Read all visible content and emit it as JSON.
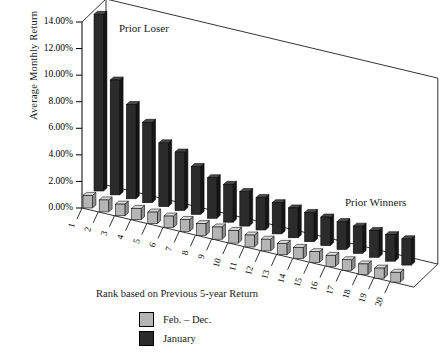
{
  "chart_data": {
    "type": "bar",
    "title": "",
    "subtitle": "",
    "xlabel": "Rank based on Previous 5-year Return",
    "ylabel": "Average Monthly Return",
    "ylim": [
      0,
      14
    ],
    "ytick_labels": [
      "0.00%",
      "2.00%",
      "4.00%",
      "6.00%",
      "8.00%",
      "10.00%",
      "12.00%",
      "14.00%"
    ],
    "ytick_values": [
      0,
      2,
      4,
      6,
      8,
      10,
      12,
      14
    ],
    "grid": false,
    "legend_position": "bottom",
    "categories": [
      "1",
      "2",
      "3",
      "4",
      "5",
      "6",
      "7",
      "8",
      "9",
      "10",
      "11",
      "12",
      "13",
      "14",
      "15",
      "16",
      "17",
      "18",
      "19",
      "20"
    ],
    "series": [
      {
        "name": "Feb. – Dec.",
        "color": "#b5b5b5",
        "values": [
          0.95,
          0.9,
          0.88,
          0.85,
          0.87,
          0.86,
          0.9,
          0.88,
          0.92,
          0.95,
          0.9,
          0.88,
          0.86,
          0.85,
          0.82,
          0.84,
          0.8,
          0.78,
          0.76,
          0.74
        ]
      },
      {
        "name": "January",
        "color": "#2b2b2b",
        "values": [
          13.3,
          8.65,
          7.1,
          6.05,
          4.8,
          4.4,
          3.6,
          3.05,
          2.85,
          2.6,
          2.45,
          2.35,
          2.25,
          2.2,
          2.15,
          2.1,
          2.05,
          2.02,
          2.0,
          1.98
        ]
      }
    ],
    "annotations": [
      {
        "id": "prior-loser",
        "text": "Prior Loser"
      },
      {
        "id": "prior-winners",
        "text": "Prior Winners"
      }
    ]
  },
  "legend": {
    "items": [
      {
        "label": "Feb. – Dec.",
        "color": "#b5b5b5"
      },
      {
        "label": "January",
        "color": "#2b2b2b"
      }
    ]
  },
  "colors": {
    "feb_dec": "#b5b5b5",
    "january": "#2b2b2b",
    "axis": "#000000",
    "background": "#ffffff"
  }
}
